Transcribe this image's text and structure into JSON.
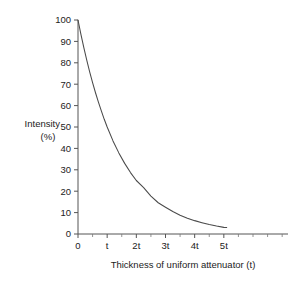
{
  "chart_data": {
    "type": "line",
    "title": "",
    "xlabel": "Thickness of uniform attenuator (t)",
    "ylabel_line1": "Intensity",
    "ylabel_line2": "(%)",
    "xlim": [
      0,
      7.2
    ],
    "ylim": [
      0,
      100
    ],
    "grid": false,
    "legend": "none",
    "x_tick_labels": [
      "0",
      "t",
      "2t",
      "3t",
      "4t",
      "5t"
    ],
    "x_tick_values": [
      0,
      1,
      2,
      3,
      4,
      5
    ],
    "x_minor_tick_values": [
      0.5,
      1.5,
      2.5,
      3.5,
      4.5,
      5.5,
      6,
      6.5,
      7
    ],
    "y_tick_labels": [
      "0",
      "10",
      "20",
      "30",
      "40",
      "50",
      "60",
      "70",
      "80",
      "90",
      "100"
    ],
    "y_tick_values": [
      0,
      10,
      20,
      30,
      40,
      50,
      60,
      70,
      80,
      90,
      100
    ],
    "series": [
      {
        "name": "Transmitted intensity",
        "x": [
          0,
          0.1,
          0.2,
          0.3,
          0.4,
          0.5,
          0.6,
          0.7,
          0.8,
          0.9,
          1,
          1.2,
          1.4,
          1.6,
          1.8,
          2,
          2.25,
          2.5,
          2.75,
          3,
          3.25,
          3.5,
          3.75,
          4,
          4.25,
          4.5,
          4.75,
          5,
          5.1
        ],
        "values": [
          100,
          93.3,
          87.1,
          81.3,
          75.8,
          70.7,
          66,
          61.6,
          57.5,
          53.6,
          50,
          43.5,
          37.9,
          33,
          28.7,
          25,
          21.7,
          17.7,
          14.6,
          12.5,
          10.5,
          8.8,
          7.4,
          6.25,
          5.3,
          4.4,
          3.7,
          3.1,
          3
        ]
      }
    ]
  }
}
